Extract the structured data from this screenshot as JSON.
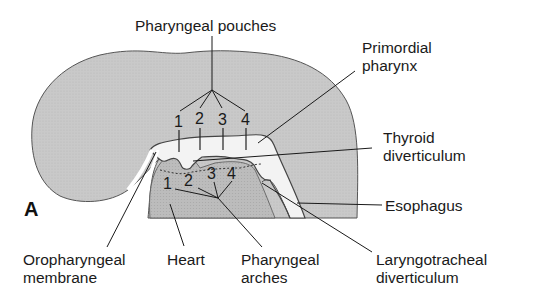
{
  "figure": {
    "panel_letter": "A",
    "colors": {
      "tissue": "#c9c9c9",
      "tissue_dark": "#bdbdbd",
      "lumen": "#f2f2f2",
      "outline": "#555555",
      "leader": "#1a1a1a"
    },
    "labels": {
      "pharyngeal_pouches": "Pharyngeal pouches",
      "primordial_pharynx_1": "Primordial",
      "primordial_pharynx_2": "pharynx",
      "thyroid_1": "Thyroid",
      "thyroid_2": "diverticulum",
      "esophagus": "Esophagus",
      "oropharyngeal_1": "Oropharyngeal",
      "oropharyngeal_2": "membrane",
      "heart": "Heart",
      "pharyngeal_arches_1": "Pharyngeal",
      "pharyngeal_arches_2": "arches",
      "laryngotracheal_1": "Laryngotracheal",
      "laryngotracheal_2": "diverticulum"
    },
    "pouch_numbers": [
      "1",
      "2",
      "3",
      "4"
    ],
    "arch_numbers": [
      "1",
      "2",
      "3",
      "4"
    ]
  }
}
